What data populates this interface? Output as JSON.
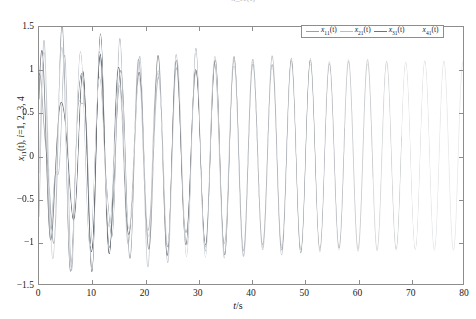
{
  "caption": {
    "fragment": "······· ··· ·· · x_i1(t) ·· ·········"
  },
  "axes": {
    "xlabel_italic": "t",
    "xlabel_rest": "/s",
    "ylabel_var": "x",
    "ylabel_sub": "i1",
    "ylabel_arg": "(t), ",
    "ylabel_index_italic": "i",
    "ylabel_index_rest": "=1, 2, 3, 4",
    "xticks": [
      0,
      10,
      20,
      30,
      40,
      50,
      60,
      70,
      80
    ],
    "xticklabels": [
      "0",
      "10",
      "20",
      "30",
      "40",
      "50",
      "60",
      "70",
      "80"
    ],
    "yticks": [
      -1.5,
      -1,
      -0.5,
      0,
      0.5,
      1,
      1.5
    ],
    "yticklabels": [
      "−1.5",
      "−1",
      "−0.5",
      "0",
      "0.5",
      "1",
      "1.5"
    ],
    "xlim": [
      0,
      80
    ],
    "ylim": [
      -1.5,
      1.5
    ],
    "grid": false,
    "frame_color": "#8d8d8d",
    "background": "#ffffff"
  },
  "legend": {
    "position": "top-right-inside",
    "entries": [
      {
        "var": "x",
        "sub": "11",
        "arg": "(t)",
        "swatch": "line",
        "color": "#9aa0a6"
      },
      {
        "var": "x",
        "sub": "21",
        "arg": "(t)",
        "swatch": "line",
        "color": "#b9bec4"
      },
      {
        "var": "x",
        "sub": "31",
        "arg": "(t)",
        "swatch": "line",
        "color": "#6f7479"
      },
      {
        "var": "x",
        "sub": "41",
        "arg": "(t)",
        "swatch": "blank",
        "color": "#cfd3d7"
      }
    ]
  },
  "chart_data": {
    "type": "line",
    "title": "",
    "xlabel": "t/s",
    "ylabel": "x_i1(t), i=1, 2, 3, 4",
    "xlim": [
      0,
      80
    ],
    "ylim": [
      -1.5,
      1.5
    ],
    "xticks": [
      0,
      10,
      20,
      30,
      40,
      50,
      60,
      70,
      80
    ],
    "yticks": [
      -1.5,
      -1,
      -0.5,
      0,
      0.5,
      1,
      1.5
    ],
    "grid": false,
    "legend_position": "upper right",
    "series": [
      {
        "name": "x11(t)",
        "color": "#9aa0a6",
        "linewidth": 0.7,
        "initial_value": 1.0,
        "amplitude_steady": 1.1,
        "period": 3.6,
        "phase": 0.0,
        "transient_decay_time": 18,
        "transient_amplitude": 0.45,
        "transient_period": 2.35
      },
      {
        "name": "x21(t)",
        "color": "#b9bec4",
        "linewidth": 0.7,
        "initial_value": -0.55,
        "amplitude_steady": 1.1,
        "period": 3.6,
        "phase": 0.0,
        "transient_decay_time": 18,
        "transient_amplitude": 0.62,
        "transient_period": 2.05
      },
      {
        "name": "x31(t)",
        "color": "#6f7479",
        "linewidth": 0.7,
        "initial_value": 0.35,
        "amplitude_steady": 1.1,
        "period": 3.6,
        "phase": 0.0,
        "transient_decay_time": 18,
        "transient_amplitude": 0.5,
        "transient_period": 2.8
      },
      {
        "name": "x41(t)",
        "color": "#cfd3d7",
        "linewidth": 0.7,
        "initial_value": -0.2,
        "amplitude_steady": 1.1,
        "period": 3.6,
        "phase": 0.0,
        "transient_decay_time": 18,
        "transient_amplitude": 0.55,
        "transient_period": 3.2
      }
    ],
    "steady_state": {
      "amplitude": 1.1,
      "period": 3.6,
      "peaks_max": 1.1,
      "peaks_min": -1.1,
      "sync_time": 20
    },
    "fade": {
      "note": "Ink density of all traces decreases with t due to print/scan fading; traces are nearly invisible beyond t=62."
    }
  }
}
